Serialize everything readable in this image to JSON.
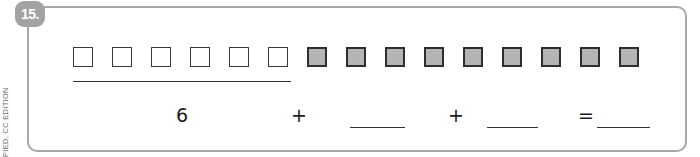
{
  "problem": {
    "number_label": "15.",
    "side_margin_text": "PIED, CC EDITION"
  },
  "model": {
    "unshaded_count": 6,
    "shaded_count": 9,
    "total_squares": 15,
    "squares": [
      {
        "shaded": false
      },
      {
        "shaded": false
      },
      {
        "shaded": false
      },
      {
        "shaded": false
      },
      {
        "shaded": false
      },
      {
        "shaded": false
      },
      {
        "shaded": true
      },
      {
        "shaded": true
      },
      {
        "shaded": true
      },
      {
        "shaded": true
      },
      {
        "shaded": true
      },
      {
        "shaded": true
      },
      {
        "shaded": true
      },
      {
        "shaded": true
      },
      {
        "shaded": true
      }
    ],
    "group_underline": "under first 6 squares"
  },
  "equation": {
    "first_addend": "6",
    "plus_1": "+",
    "blank_1": "",
    "plus_2": "+",
    "blank_2": "",
    "equals": "=",
    "blank_3": ""
  },
  "colors": {
    "frame_border": "#a8a8a8",
    "badge_bg": "#a3a3a3",
    "shaded_square": "#b4b4b4",
    "square_border": "#333333"
  }
}
